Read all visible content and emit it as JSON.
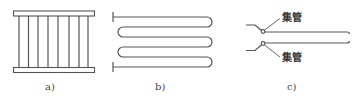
{
  "figure": {
    "panels": [
      {
        "id": "a",
        "label": "a)",
        "description": "parallel tube panel with top and bottom headers",
        "vertical_tube_count": 8
      },
      {
        "id": "b",
        "label": "b)",
        "description": "serpentine coil tube",
        "passes": 6
      },
      {
        "id": "c",
        "label": "c)",
        "description": "side view of tubes joined to headers",
        "annotations": [
          {
            "text": "集管",
            "position": "upper"
          },
          {
            "text": "集管",
            "position": "lower"
          }
        ]
      }
    ],
    "colors": {
      "line": "#555555",
      "text": "#444444",
      "background": "#ffffff"
    }
  }
}
